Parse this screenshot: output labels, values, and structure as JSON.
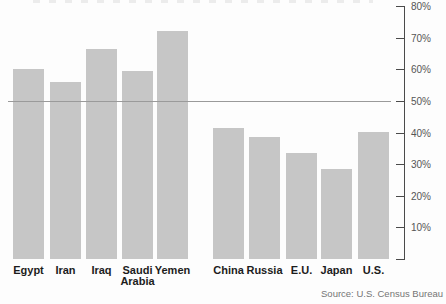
{
  "chart_data": {
    "type": "bar",
    "categories": [
      "Egypt",
      "Iran",
      "Iraq",
      "Saudi Arabia",
      "Yemen",
      "China",
      "Russia",
      "E.U.",
      "Japan",
      "U.S."
    ],
    "values": [
      60,
      56,
      66.5,
      59.5,
      72,
      41.5,
      38.5,
      33.5,
      28.5,
      40
    ],
    "group_split_index": 5,
    "title": "",
    "xlabel": "",
    "ylabel": "",
    "ylim": [
      0,
      80
    ],
    "ytick_labels": [
      "80%",
      "70%",
      "60%",
      "50%",
      "40%",
      "30%",
      "20%",
      "10%"
    ],
    "axis_side": "right",
    "reference_line_percent": 50,
    "grid": "single-reference-line",
    "legend": "none",
    "bar_color": "#c6c6c6",
    "axis_color": "#4a4a4a",
    "source": "Source: U.S. Census Bureau"
  }
}
